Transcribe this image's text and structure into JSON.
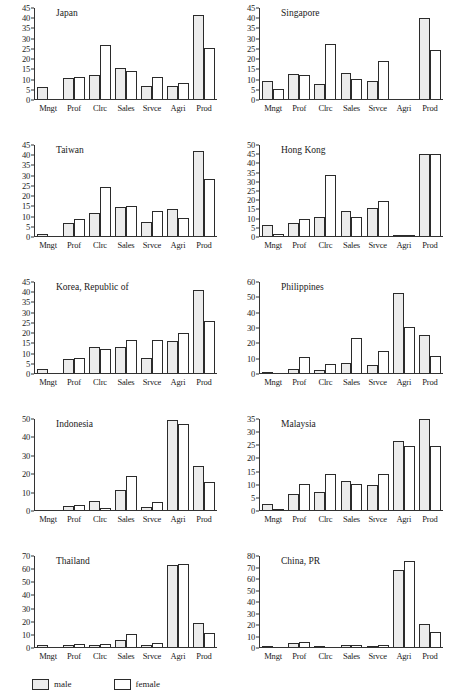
{
  "figure": {
    "layout": "2 columns x 5 rows small multiples",
    "legend": {
      "male_label": "male",
      "female_label": "female",
      "male_color": "#ececec",
      "female_color": "#ffffff",
      "border_color": "#2b2b2b"
    }
  },
  "chart_data": [
    {
      "type": "bar",
      "title": "Japan",
      "categories": [
        "Mngt",
        "Prof",
        "Clrc",
        "Sales",
        "Srvce",
        "Agri",
        "Prod"
      ],
      "series": [
        {
          "name": "male",
          "values": [
            6.3,
            10.6,
            12.2,
            15.5,
            6.7,
            6.7,
            41.6
          ]
        },
        {
          "name": "female",
          "values": [
            0.7,
            11.4,
            27.0,
            14.1,
            11.1,
            8.4,
            25.5
          ]
        }
      ],
      "xlabel": "",
      "ylabel": "",
      "ylim": [
        0,
        45
      ],
      "yticks": [
        0,
        5,
        10,
        15,
        20,
        25,
        30,
        35,
        40,
        45
      ],
      "grid": false
    },
    {
      "type": "bar",
      "title": "Singapore",
      "categories": [
        "Mngt",
        "Prof",
        "Clrc",
        "Sales",
        "Srvce",
        "Agri",
        "Prod"
      ],
      "series": [
        {
          "name": "male",
          "values": [
            9.4,
            12.7,
            7.6,
            13.2,
            9.4,
            0.4,
            40.1
          ]
        },
        {
          "name": "female",
          "values": [
            5.6,
            12.3,
            27.4,
            10.2,
            19.0,
            0.4,
            24.6
          ]
        }
      ],
      "xlabel": "",
      "ylabel": "",
      "ylim": [
        0,
        45
      ],
      "yticks": [
        0,
        5,
        10,
        15,
        20,
        25,
        30,
        35,
        40,
        45
      ],
      "grid": false
    },
    {
      "type": "bar",
      "title": "Taiwan",
      "categories": [
        "Mngt",
        "Prof",
        "Clrc",
        "Sales",
        "Srvce",
        "Agri",
        "Prod"
      ],
      "series": [
        {
          "name": "male",
          "values": [
            1.4,
            7.1,
            11.9,
            14.8,
            7.3,
            13.5,
            42.2
          ]
        },
        {
          "name": "female",
          "values": [
            0.6,
            8.6,
            24.5,
            15.3,
            12.8,
            9.1,
            28.6
          ]
        }
      ],
      "xlabel": "",
      "ylabel": "",
      "ylim": [
        0,
        45
      ],
      "yticks": [
        0,
        5,
        10,
        15,
        20,
        25,
        30,
        35,
        40,
        45
      ],
      "grid": false
    },
    {
      "type": "bar",
      "title": "Hong Kong",
      "categories": [
        "Mngt",
        "Prof",
        "Clrc",
        "Sales",
        "Srvce",
        "Agri",
        "Prod"
      ],
      "series": [
        {
          "name": "male",
          "values": [
            6.8,
            7.6,
            11.0,
            14.1,
            16.0,
            1.0,
            45.0
          ]
        },
        {
          "name": "female",
          "values": [
            1.8,
            9.6,
            33.5,
            10.8,
            19.8,
            0.9,
            45.0
          ]
        }
      ],
      "xlabel": "",
      "ylabel": "",
      "ylim": [
        0,
        50
      ],
      "yticks": [
        0,
        5,
        10,
        15,
        20,
        25,
        30,
        35,
        40,
        45,
        50
      ],
      "grid": false
    },
    {
      "type": "bar",
      "title": "Korea, Republic of",
      "categories": [
        "Mngt",
        "Prof",
        "Clrc",
        "Sales",
        "Srvce",
        "Agri",
        "Prod"
      ],
      "series": [
        {
          "name": "male",
          "values": [
            2.3,
            7.2,
            13.0,
            13.0,
            7.8,
            16.1,
            41.0
          ]
        },
        {
          "name": "female",
          "values": [
            0.4,
            7.6,
            12.3,
            16.7,
            16.7,
            20.1,
            25.8
          ]
        }
      ],
      "xlabel": "",
      "ylabel": "",
      "ylim": [
        0,
        45
      ],
      "yticks": [
        0,
        5,
        10,
        15,
        20,
        25,
        30,
        35,
        40,
        45
      ],
      "grid": false
    },
    {
      "type": "bar",
      "title": "Philippines",
      "categories": [
        "Mngt",
        "Prof",
        "Clrc",
        "Sales",
        "Srvce",
        "Agri",
        "Prod"
      ],
      "series": [
        {
          "name": "male",
          "values": [
            1.0,
            3.4,
            2.9,
            7.0,
            5.6,
            52.8,
            25.5
          ]
        },
        {
          "name": "female",
          "values": [
            0.9,
            11.0,
            6.5,
            23.8,
            14.8,
            30.6,
            11.5
          ]
        }
      ],
      "xlabel": "",
      "ylabel": "",
      "ylim": [
        0,
        60
      ],
      "yticks": [
        0,
        10,
        20,
        30,
        40,
        50,
        60
      ],
      "grid": false
    },
    {
      "type": "bar",
      "title": "Indonesia",
      "categories": [
        "Mngt",
        "Prof",
        "Clrc",
        "Sales",
        "Srvce",
        "Agri",
        "Prod"
      ],
      "series": [
        {
          "name": "male",
          "values": [
            0.4,
            2.7,
            5.2,
            11.2,
            2.3,
            49.4,
            24.6
          ]
        },
        {
          "name": "female",
          "values": [
            0.3,
            3.5,
            1.9,
            18.8,
            4.9,
            47.4,
            15.5
          ]
        }
      ],
      "xlabel": "",
      "ylabel": "",
      "ylim": [
        0,
        50
      ],
      "yticks": [
        0,
        10,
        20,
        30,
        40,
        50
      ],
      "grid": false
    },
    {
      "type": "bar",
      "title": "Malaysia",
      "categories": [
        "Mngt",
        "Prof",
        "Clrc",
        "Sales",
        "Srvce",
        "Agri",
        "Prod"
      ],
      "series": [
        {
          "name": "male",
          "values": [
            2.7,
            6.3,
            7.1,
            11.5,
            9.8,
            26.7,
            34.9
          ]
        },
        {
          "name": "female",
          "values": [
            0.6,
            10.1,
            14.1,
            10.4,
            13.9,
            24.8,
            24.9
          ]
        }
      ],
      "xlabel": "",
      "ylabel": "",
      "ylim": [
        0,
        35
      ],
      "yticks": [
        0,
        5,
        10,
        15,
        20,
        25,
        30,
        35
      ],
      "grid": false
    },
    {
      "type": "bar",
      "title": "Thailand",
      "categories": [
        "Mngt",
        "Prof",
        "Clrc",
        "Sales",
        "Srvce",
        "Agri",
        "Prod"
      ],
      "series": [
        {
          "name": "male",
          "values": [
            2.1,
            2.6,
            2.5,
            6.0,
            2.5,
            63.0,
            19.3
          ]
        },
        {
          "name": "female",
          "values": [
            0.6,
            3.1,
            2.7,
            11.0,
            4.0,
            64.3,
            11.6
          ]
        }
      ],
      "xlabel": "",
      "ylabel": "",
      "ylim": [
        0,
        70
      ],
      "yticks": [
        0,
        10,
        20,
        30,
        40,
        50,
        60,
        70
      ],
      "grid": false
    },
    {
      "type": "bar",
      "title": "China, PR",
      "categories": [
        "Mngt",
        "Prof",
        "Clrc",
        "Sales",
        "Srvce",
        "Agri",
        "Prod"
      ],
      "series": [
        {
          "name": "male",
          "values": [
            2.1,
            4.5,
            1.5,
            2.2,
            1.5,
            68.0,
            20.5
          ]
        },
        {
          "name": "female",
          "values": [
            0.6,
            4.8,
            0.9,
            2.5,
            2.8,
            76.1,
            13.8
          ]
        }
      ],
      "xlabel": "",
      "ylabel": "",
      "ylim": [
        0,
        80
      ],
      "yticks": [
        0,
        10,
        20,
        30,
        40,
        50,
        60,
        70,
        80
      ],
      "grid": false
    }
  ]
}
